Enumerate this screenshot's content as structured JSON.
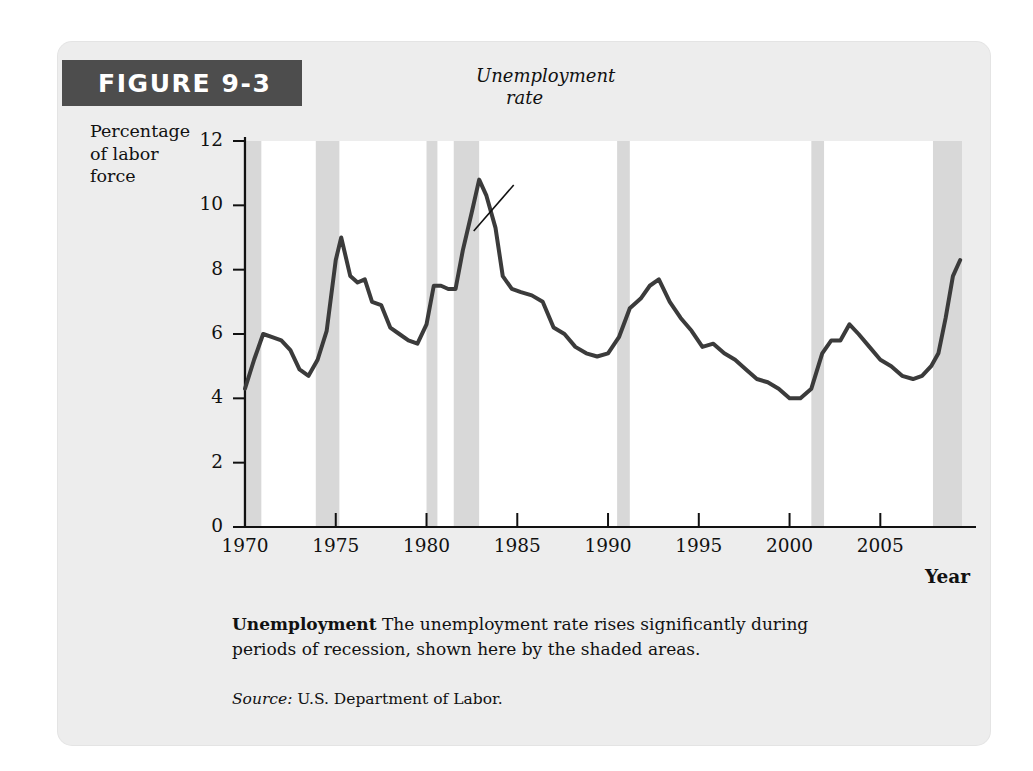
{
  "figure": {
    "banner_label": "FIGURE 9-3",
    "banner_color": "#4d4d4d",
    "card_background": "#ededed"
  },
  "caption": {
    "title": "Unemployment",
    "text": " The unemployment rate rises significantly during periods of recession, shown here by the shaded areas.",
    "source_label": "Source:",
    "source_text": " U.S. Department of Labor."
  },
  "chart_data": {
    "type": "line",
    "title": "Unemployment",
    "xlabel": "Year",
    "ylabel": "Percentage of labor force",
    "ylabel_lines": [
      "Percentage",
      "of labor",
      "force"
    ],
    "xlim": [
      1970,
      2009.5
    ],
    "ylim": [
      0,
      12
    ],
    "grid": false,
    "legend": "none",
    "line_color": "#3b3b3b",
    "line_width": 4,
    "recession_color": "#d8d8d8",
    "plot_background": "#ffffff",
    "yticks": [
      0,
      2,
      4,
      6,
      8,
      10,
      12
    ],
    "ytick_labels": [
      "0",
      "2",
      "4",
      "6",
      "8",
      "10",
      "12"
    ],
    "xticks": [
      1970,
      1975,
      1980,
      1985,
      1990,
      1995,
      2000,
      2005
    ],
    "xtick_labels": [
      "1970",
      "1975",
      "1980",
      "1985",
      "1990",
      "1995",
      "2000",
      "2005"
    ],
    "annotations": [
      {
        "text": "Unemployment rate",
        "lines": [
          "Unemployment",
          "rate"
        ],
        "style": "italic",
        "points_to_x": 1982.6,
        "points_to_y": 9.2
      }
    ],
    "recession_bands": [
      {
        "name": "1969-1970 recession",
        "start": 1969.9,
        "end": 1970.9
      },
      {
        "name": "1973-1975 recession",
        "start": 1973.9,
        "end": 1975.2
      },
      {
        "name": "1980 recession",
        "start": 1980.0,
        "end": 1980.6
      },
      {
        "name": "1981-1982 recession",
        "start": 1981.5,
        "end": 1982.9
      },
      {
        "name": "1990-1991 recession",
        "start": 1990.5,
        "end": 1991.2
      },
      {
        "name": "2001 recession",
        "start": 2001.2,
        "end": 2001.9
      },
      {
        "name": "2007-2009 recession",
        "start": 2007.9,
        "end": 2009.5
      }
    ],
    "series": [
      {
        "name": "Unemployment rate",
        "x": [
          1970.0,
          1970.5,
          1971.0,
          1971.5,
          1972.0,
          1972.5,
          1973.0,
          1973.5,
          1974.0,
          1974.5,
          1975.0,
          1975.3,
          1975.8,
          1976.2,
          1976.6,
          1977.0,
          1977.5,
          1978.0,
          1978.5,
          1979.0,
          1979.5,
          1980.0,
          1980.4,
          1980.8,
          1981.2,
          1981.6,
          1982.0,
          1982.5,
          1982.9,
          1983.3,
          1983.8,
          1984.2,
          1984.7,
          1985.2,
          1985.8,
          1986.4,
          1987.0,
          1987.6,
          1988.2,
          1988.8,
          1989.4,
          1990.0,
          1990.6,
          1991.2,
          1991.8,
          1992.3,
          1992.8,
          1993.4,
          1994.0,
          1994.6,
          1995.2,
          1995.8,
          1996.4,
          1997.0,
          1997.6,
          1998.2,
          1998.8,
          1999.4,
          2000.0,
          2000.6,
          2001.2,
          2001.8,
          2002.3,
          2002.8,
          2003.3,
          2003.8,
          2004.4,
          2005.0,
          2005.6,
          2006.2,
          2006.8,
          2007.3,
          2007.8,
          2008.2,
          2008.6,
          2009.0,
          2009.4
        ],
        "y": [
          4.3,
          5.2,
          6.0,
          5.9,
          5.8,
          5.5,
          4.9,
          4.7,
          5.2,
          6.1,
          8.3,
          9.0,
          7.8,
          7.6,
          7.7,
          7.0,
          6.9,
          6.2,
          6.0,
          5.8,
          5.7,
          6.3,
          7.5,
          7.5,
          7.4,
          7.4,
          8.6,
          9.8,
          10.8,
          10.3,
          9.3,
          7.8,
          7.4,
          7.3,
          7.2,
          7.0,
          6.2,
          6.0,
          5.6,
          5.4,
          5.3,
          5.4,
          5.9,
          6.8,
          7.1,
          7.5,
          7.7,
          7.0,
          6.5,
          6.1,
          5.6,
          5.7,
          5.4,
          5.2,
          4.9,
          4.6,
          4.5,
          4.3,
          4.0,
          4.0,
          4.3,
          5.4,
          5.8,
          5.8,
          6.3,
          6.0,
          5.6,
          5.2,
          5.0,
          4.7,
          4.6,
          4.7,
          5.0,
          5.4,
          6.5,
          7.8,
          8.3
        ]
      }
    ]
  }
}
